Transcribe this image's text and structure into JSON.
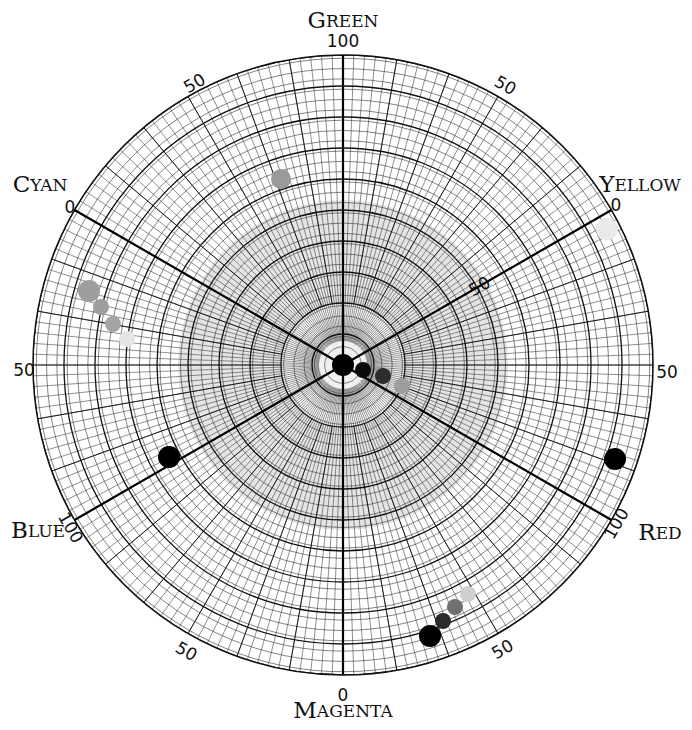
{
  "chart_data": {
    "type": "scatter",
    "subtype": "polar color-circle chart",
    "title": "",
    "center": [
      343,
      365
    ],
    "outer_radius": 310,
    "radial_scale": {
      "min": 0,
      "max": 100
    },
    "axes": [
      {
        "name": "Green",
        "first": "G",
        "rest": "REEN",
        "angle_deg": 90,
        "end_label": "100"
      },
      {
        "name": "Yellow",
        "first": "Y",
        "rest": "ELLOW",
        "angle_deg": 30,
        "end_label": "0"
      },
      {
        "name": "Red",
        "first": "R",
        "rest": "ED",
        "angle_deg": -30,
        "end_label": "100"
      },
      {
        "name": "Magenta",
        "first": "M",
        "rest": "AGENTA",
        "angle_deg": -90,
        "end_label": "0"
      },
      {
        "name": "Blue",
        "first": "B",
        "rest": "LUE",
        "angle_deg": 210,
        "end_label": "100"
      },
      {
        "name": "Cyan",
        "first": "C",
        "rest": "YAN",
        "angle_deg": 150,
        "end_label": "0"
      }
    ],
    "tick_labels": [
      {
        "text": "100",
        "x": 343,
        "y": 42,
        "rot": 0
      },
      {
        "text": "50",
        "x": 195,
        "y": 84,
        "rot": -30
      },
      {
        "text": "50",
        "x": 505,
        "y": 86,
        "rot": 30
      },
      {
        "text": "0",
        "x": 70,
        "y": 208,
        "rot": 0
      },
      {
        "text": "0",
        "x": 616,
        "y": 206,
        "rot": 0
      },
      {
        "text": "50",
        "x": 480,
        "y": 287,
        "rot": -30
      },
      {
        "text": "50",
        "x": 24,
        "y": 371,
        "rot": 0
      },
      {
        "text": "50",
        "x": 667,
        "y": 373,
        "rot": 0
      },
      {
        "text": "100",
        "x": 70,
        "y": 528,
        "rot": 60
      },
      {
        "text": "100",
        "x": 617,
        "y": 524,
        "rot": -60
      },
      {
        "text": "50",
        "x": 186,
        "y": 652,
        "rot": 30
      },
      {
        "text": "50",
        "x": 503,
        "y": 650,
        "rot": -30
      },
      {
        "text": "0",
        "x": 343,
        "y": 696,
        "rot": 0
      }
    ],
    "points": [
      {
        "x": 343,
        "y": 365,
        "r": 11,
        "color": "#000000"
      },
      {
        "x": 363,
        "y": 370,
        "r": 8,
        "color": "#0a0a0a"
      },
      {
        "x": 383,
        "y": 376,
        "r": 8,
        "color": "#2e2e2e"
      },
      {
        "x": 402,
        "y": 386,
        "r": 8,
        "color": "#9e9e9e"
      },
      {
        "x": 281,
        "y": 179,
        "r": 10,
        "color": "#9a9a9a"
      },
      {
        "x": 607,
        "y": 229,
        "r": 11,
        "color": "#eaeaea"
      },
      {
        "x": 89,
        "y": 291,
        "r": 11,
        "color": "#9e9e9e"
      },
      {
        "x": 101,
        "y": 307,
        "r": 8,
        "color": "#9e9e9e"
      },
      {
        "x": 113,
        "y": 324,
        "r": 8,
        "color": "#a4a4a4"
      },
      {
        "x": 127,
        "y": 339,
        "r": 8,
        "color": "#e6e6e6"
      },
      {
        "x": 169,
        "y": 457,
        "r": 11,
        "color": "#000000"
      },
      {
        "x": 615,
        "y": 459,
        "r": 11,
        "color": "#000000"
      },
      {
        "x": 430,
        "y": 636,
        "r": 11,
        "color": "#000000"
      },
      {
        "x": 443,
        "y": 621,
        "r": 8,
        "color": "#2a2a2a"
      },
      {
        "x": 455,
        "y": 607,
        "r": 8,
        "color": "#707070"
      },
      {
        "x": 468,
        "y": 594,
        "r": 8,
        "color": "#cfcfcf"
      }
    ],
    "grid": true,
    "legend": null
  }
}
